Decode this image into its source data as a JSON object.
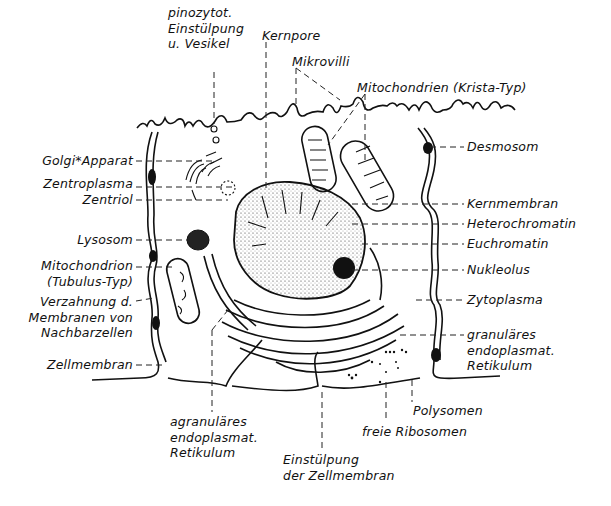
{
  "figure": {
    "colors": {
      "ink": "#111111",
      "background": "#ffffff"
    },
    "labels": {
      "pinozytot": "pinozytot.\nEinstülpung\nu. Vesikel",
      "kernpore": "Kernpore",
      "mikrovilli": "Mikrovilli",
      "mito_krista": "Mitochondrien (Krista-Typ)",
      "golgi": "Golgi*Apparat",
      "zentroplasma": "Zentroplasma",
      "zentriol": "Zentriol",
      "lysosom": "Lysosom",
      "mito_tubulus": "Mitochondrion\n(Tubulus-Typ)",
      "verzahnung": "Verzahnung d.\nMembranen von\nNachbarzellen",
      "zellmembran": "Zellmembran",
      "desmosom": "Desmosom",
      "kernmembran": "Kernmembran",
      "heterochromatin": "Heterochromatin",
      "euchromatin": "Euchromatin",
      "nukleolus": "Nukleolus",
      "zytoplasma": "Zytoplasma",
      "granulaeres_er": "granuläres\nendoplasmat.\nRetikulum",
      "polysomen": "Polysomen",
      "freie_ribosomen": "freie Ribosomen",
      "agranulaeres_er": "agranuläres\nendoplasmat.\nRetikulum",
      "einstuelpung": "Einstülpung\nder Zellmembran"
    }
  }
}
